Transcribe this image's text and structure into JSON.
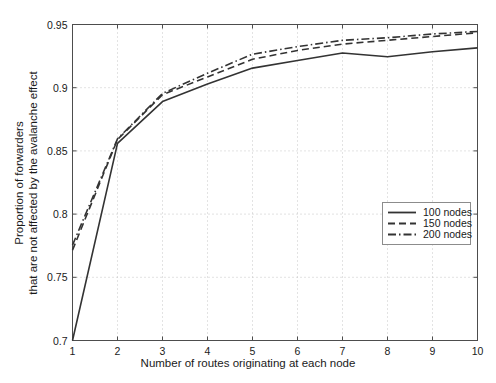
{
  "chart_data": {
    "type": "line",
    "title": "",
    "xlabel": "Number of routes originating at each node",
    "ylabel_line1": "Proportion of forwarders",
    "ylabel_line2": "that are not affected by the avalanche effect",
    "x": [
      1,
      2,
      3,
      4,
      5,
      6,
      7,
      8,
      9,
      10
    ],
    "xlim": [
      1,
      10
    ],
    "ylim": [
      0.7,
      0.95
    ],
    "xticks": [
      "1",
      "2",
      "3",
      "4",
      "5",
      "6",
      "7",
      "8",
      "9",
      "10"
    ],
    "yticks": [
      "0.7",
      "0.75",
      "0.8",
      "0.85",
      "0.9",
      "0.95"
    ],
    "ytick_values": [
      0.7,
      0.75,
      0.8,
      0.85,
      0.9,
      0.95
    ],
    "grid": true,
    "grid_style": "dotted",
    "legend_position": "lower right",
    "series": [
      {
        "name": "100 nodes",
        "label": "100 nodes",
        "style": "solid",
        "color": "#333333",
        "values": [
          0.7,
          0.856,
          0.889,
          0.903,
          0.9155,
          0.9215,
          0.9275,
          0.9245,
          0.9285,
          0.9315
        ]
      },
      {
        "name": "150 nodes",
        "label": "150 nodes",
        "style": "dashed",
        "color": "#333333",
        "values": [
          0.7715,
          0.859,
          0.8945,
          0.9085,
          0.9225,
          0.9295,
          0.9345,
          0.9375,
          0.9405,
          0.9435
        ]
      },
      {
        "name": "200 nodes",
        "label": "200 nodes",
        "style": "dashdot",
        "color": "#333333",
        "values": [
          0.7755,
          0.8595,
          0.8955,
          0.9115,
          0.9265,
          0.9325,
          0.9375,
          0.9395,
          0.9425,
          0.9445
        ]
      }
    ]
  },
  "legend": {
    "entries": [
      {
        "label": "100 nodes"
      },
      {
        "label": "150 nodes"
      },
      {
        "label": "200 nodes"
      }
    ]
  },
  "axes": {
    "frame_color": "#4d4d4d",
    "grid_color": "#b8b8b8"
  }
}
